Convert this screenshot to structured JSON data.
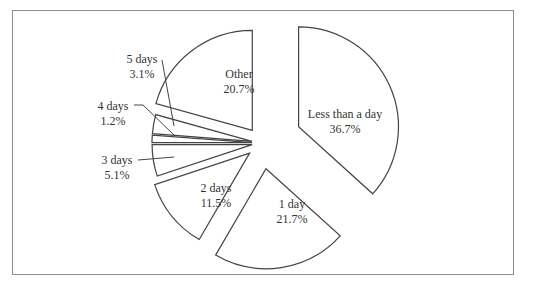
{
  "chart_data": {
    "type": "pie",
    "title": "",
    "exploded": true,
    "start_angle_deg": 0,
    "direction": "clockwise",
    "slices": [
      {
        "label": "Less than a day",
        "value": 36.7,
        "display": "36.7%"
      },
      {
        "label": "1 day",
        "value": 21.7,
        "display": "21.7%"
      },
      {
        "label": "2 days",
        "value": 11.5,
        "display": "11.5%"
      },
      {
        "label": "3 days",
        "value": 5.1,
        "display": "5.1%"
      },
      {
        "label": "4 days",
        "value": 1.2,
        "display": "1.2%"
      },
      {
        "label": "5 days",
        "value": 3.1,
        "display": "3.1%"
      },
      {
        "label": "Other",
        "value": 20.7,
        "display": "20.7%"
      }
    ],
    "legend": "none",
    "label_position": "inside for large slices, leader lines for small slices"
  },
  "colors": {
    "slice_fill": "#ffffff",
    "slice_stroke": "#444444",
    "frame_stroke": "#8c8c8c",
    "text": "#333333"
  }
}
